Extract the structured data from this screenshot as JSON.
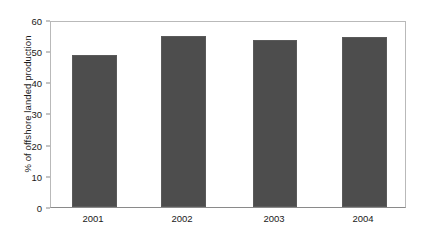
{
  "chart_data": {
    "type": "bar",
    "title": "",
    "subtitle": "",
    "xlabel": "",
    "ylabel": "% of offshore landed production",
    "categories": [
      "2001",
      "2002",
      "2003",
      "2004"
    ],
    "values": [
      49.2,
      55.5,
      54.2,
      55.0
    ],
    "series": [
      {
        "name": "% of offshore landed production",
        "values": [
          49.2,
          55.5,
          54.2,
          55.0
        ]
      }
    ],
    "ylim": [
      0,
      60
    ],
    "yticks": [
      0,
      10,
      20,
      30,
      40,
      50,
      60
    ],
    "ytick_labels": [
      "0",
      "10",
      "20",
      "30",
      "40",
      "50",
      "60"
    ],
    "grid": false,
    "legend": false,
    "legend_position": "none",
    "bar_color": "#4d4d4d",
    "bar_edge_color": "#5a5a5a",
    "axis_color": "#8a8a8a",
    "frame_color": "#b9b9b9",
    "background_color": "#ffffff",
    "text_color": "#1a1a1a",
    "annotations": []
  }
}
